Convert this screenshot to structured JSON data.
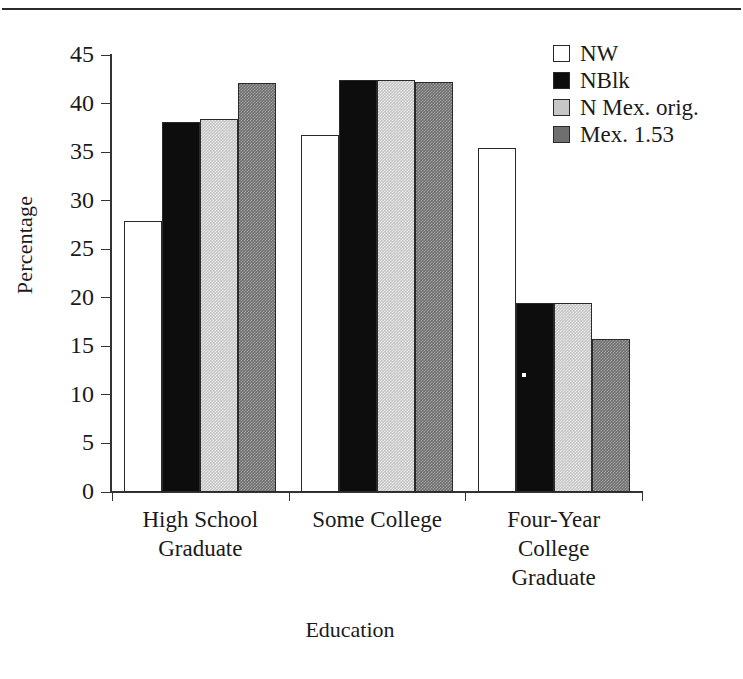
{
  "chart_data": {
    "type": "bar",
    "title": "",
    "xlabel": "Education",
    "ylabel": "Percentage",
    "categories": [
      "High School Graduate",
      "Some College",
      "Four-Year College Graduate"
    ],
    "category_lines": [
      [
        "High School",
        "Graduate"
      ],
      [
        "Some College"
      ],
      [
        "Four-Year",
        "College",
        "Graduate"
      ]
    ],
    "series": [
      {
        "name": "NW",
        "color": "#ffffff",
        "values": [
          27.9,
          36.8,
          35.4
        ]
      },
      {
        "name": "NBlk",
        "color": "#0d0d0d",
        "values": [
          38.1,
          42.4,
          19.5
        ]
      },
      {
        "name": "N Mex. orig.",
        "color": "#c6c6c6",
        "values": [
          38.4,
          42.4,
          19.5
        ]
      },
      {
        "name": "Mex. 1.53",
        "color": "#6f6f6f",
        "values": [
          42.1,
          42.2,
          15.8
        ]
      }
    ],
    "ylim": [
      0,
      45
    ],
    "yticks": [
      0,
      5,
      10,
      15,
      20,
      25,
      30,
      35,
      40,
      45
    ],
    "ytick_labels": [
      "0",
      "5",
      "10",
      "15",
      "20",
      "25",
      "30",
      "35",
      "40",
      "45"
    ],
    "grid": false,
    "legend_position": "top-right",
    "axis_color": "#333333",
    "bar_edge_color": "#2a2a2a"
  }
}
